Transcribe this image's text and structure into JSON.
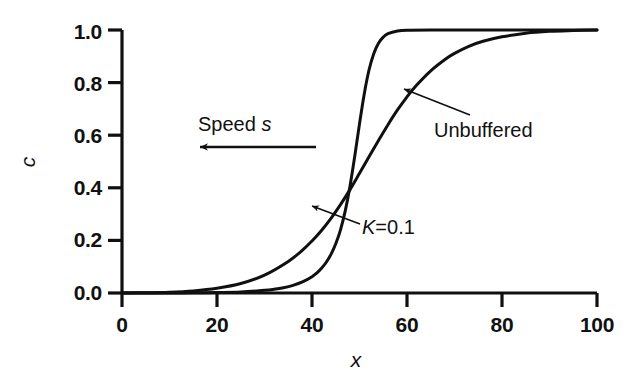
{
  "chart_data": {
    "type": "line",
    "title": "",
    "xlabel": "x",
    "ylabel": "c",
    "xlim": [
      0,
      100
    ],
    "ylim": [
      0.0,
      1.0
    ],
    "grid": false,
    "legend_position": "inline-annotations",
    "x_ticks": [
      "0",
      "20",
      "40",
      "60",
      "80",
      "100"
    ],
    "x_tick_values": [
      0,
      20,
      40,
      60,
      80,
      100
    ],
    "y_ticks": [
      "0.0",
      "0.2",
      "0.4",
      "0.6",
      "0.8",
      "1.0"
    ],
    "y_tick_values": [
      0.0,
      0.2,
      0.4,
      0.6,
      0.8,
      1.0
    ],
    "series": [
      {
        "name": "K=0.1",
        "label_text": "K=0.1",
        "x": [
          0,
          5,
          10,
          15,
          20,
          25,
          30,
          32,
          34,
          36,
          38,
          40,
          41,
          42,
          43,
          44,
          45,
          46,
          47,
          48,
          49,
          50,
          51,
          52,
          53,
          54,
          55,
          56,
          58,
          60,
          65,
          70,
          80,
          90,
          100
        ],
        "values": [
          0.0,
          0.0,
          0.0,
          0.001,
          0.002,
          0.004,
          0.01,
          0.014,
          0.02,
          0.029,
          0.042,
          0.062,
          0.076,
          0.094,
          0.117,
          0.147,
          0.187,
          0.24,
          0.312,
          0.406,
          0.52,
          0.643,
          0.757,
          0.848,
          0.91,
          0.95,
          0.973,
          0.986,
          0.996,
          0.999,
          1.0,
          1.0,
          1.0,
          1.0,
          1.0
        ]
      },
      {
        "name": "Unbuffered",
        "label_text": "Unbuffered",
        "x": [
          0,
          5,
          10,
          15,
          20,
          25,
          30,
          35,
          38,
          40,
          42,
          44,
          46,
          48,
          50,
          52,
          54,
          56,
          58,
          60,
          62,
          65,
          68,
          70,
          73,
          76,
          80,
          85,
          90,
          95,
          100
        ],
        "values": [
          0.0,
          0.001,
          0.003,
          0.008,
          0.018,
          0.036,
          0.068,
          0.12,
          0.163,
          0.198,
          0.238,
          0.284,
          0.336,
          0.393,
          0.455,
          0.518,
          0.58,
          0.64,
          0.696,
          0.746,
          0.79,
          0.845,
          0.888,
          0.911,
          0.938,
          0.957,
          0.974,
          0.988,
          0.995,
          0.998,
          1.0
        ]
      }
    ],
    "annotations": [
      {
        "name": "speed-arrow",
        "text": "Speed s",
        "italic_part": "s",
        "direction": "left",
        "text_x": 52,
        "text_y": 0.72,
        "arrow_from_x": 62,
        "arrow_to_x": 32,
        "arrow_y": 0.56
      },
      {
        "name": "unbuffered-callout",
        "text": "Unbuffered",
        "target_x": 59,
        "target_y": 0.79,
        "text_x": 66,
        "text_y": 0.605
      },
      {
        "name": "k-callout",
        "text": "K=0.1",
        "target_x": 48.5,
        "target_y": 0.285,
        "text_x": 56,
        "text_y": 0.2
      }
    ]
  },
  "style": {
    "line_color": "#101010",
    "axis_color": "#101010",
    "background": "#ffffff"
  }
}
